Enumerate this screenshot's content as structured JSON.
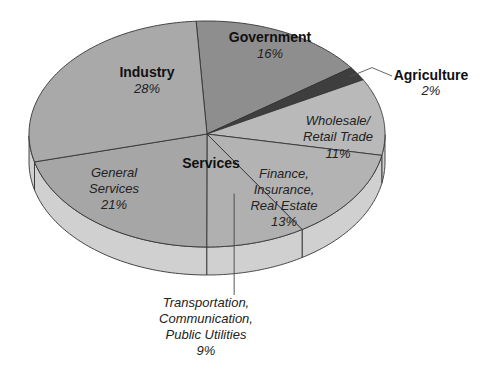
{
  "chart_data": {
    "type": "pie",
    "title": "",
    "style": "3d-tilted",
    "group_labels": [
      {
        "label": "Services",
        "covers": [
          "Wholesale/Retail Trade",
          "Finance, Insurance, Real Estate",
          "Transportation, Communication, Public Utilities",
          "General Services"
        ]
      }
    ],
    "slices": [
      {
        "name": "Industry",
        "label_lines": [
          "Industry"
        ],
        "value": 28,
        "value_label": "28%",
        "color": "#a9a9a9",
        "label_style": "bold"
      },
      {
        "name": "Government",
        "label_lines": [
          "Government"
        ],
        "value": 16,
        "value_label": "16%",
        "color": "#8e8e8e",
        "label_style": "bold"
      },
      {
        "name": "Agriculture",
        "label_lines": [
          "Agriculture"
        ],
        "value": 2,
        "value_label": "2%",
        "color": "#3e3e3e",
        "label_style": "bold",
        "callout": true
      },
      {
        "name": "Wholesale/Retail Trade",
        "label_lines": [
          "Wholesale/",
          "Retail Trade"
        ],
        "value": 11,
        "value_label": "11%",
        "color": "#b9b9b9",
        "label_style": "italic"
      },
      {
        "name": "Finance, Insurance, Real Estate",
        "label_lines": [
          "Finance,",
          "Insurance,",
          "Real Estate"
        ],
        "value": 13,
        "value_label": "13%",
        "color": "#b3b3b3",
        "label_style": "italic"
      },
      {
        "name": "Transportation, Communication, Public Utilities",
        "label_lines": [
          "Transportation,",
          "Communication,",
          "Public Utilities"
        ],
        "value": 9,
        "value_label": "9%",
        "color": "#b0b0b0",
        "label_style": "italic",
        "callout": true
      },
      {
        "name": "General Services",
        "label_lines": [
          "General",
          "Services"
        ],
        "value": 21,
        "value_label": "21%",
        "color": "#a6a6a6",
        "label_style": "italic"
      }
    ],
    "side_color": "#d0d0d0",
    "edge_color": "#333333"
  }
}
